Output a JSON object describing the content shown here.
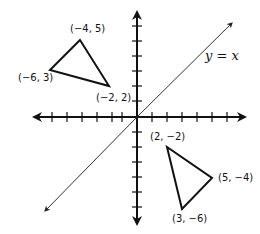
{
  "diagram": {
    "type": "coordinate-plane-reflection",
    "line_label": "y = x",
    "line_label_parts": {
      "y": "y",
      "eq": " = ",
      "x": "x"
    },
    "colors": {
      "axis": "#111111",
      "line": "#333333",
      "triangle": "#111111",
      "text": "#111111",
      "background": "#ffffff"
    },
    "axes": {
      "x_ticks_each_side": 6,
      "y_ticks_each_side": 7
    },
    "triangle_a": {
      "vertices": [
        {
          "label": "(−4, 5)",
          "x": -4,
          "y": 5
        },
        {
          "label": "(−6, 3)",
          "x": -6,
          "y": 3
        },
        {
          "label": "(−2, 2)",
          "x": -2,
          "y": 2
        }
      ]
    },
    "triangle_b": {
      "vertices": [
        {
          "label": "(2, −2)",
          "x": 2,
          "y": -2
        },
        {
          "label": "(5, −4)",
          "x": 5,
          "y": -4
        },
        {
          "label": "(3, −6)",
          "x": 3,
          "y": -6
        }
      ]
    }
  }
}
